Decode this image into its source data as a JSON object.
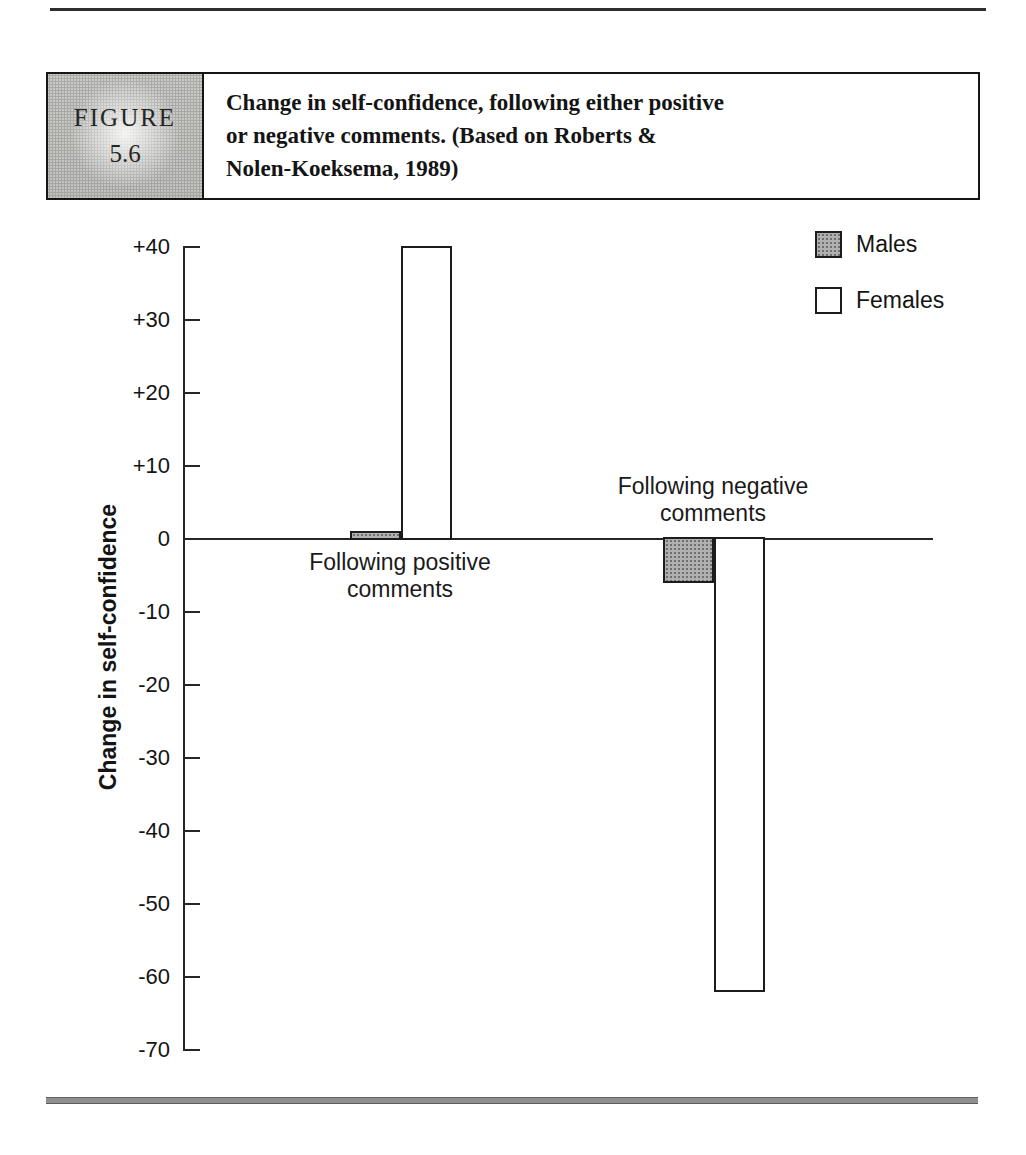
{
  "header": {
    "figure_word": "FIGURE",
    "figure_number": "5.6",
    "caption_lines": [
      "Change in self-confidence, following either positive",
      "or negative comments. (Based on Roberts &",
      "Nolen-Koeksema, 1989)"
    ]
  },
  "chart_data": {
    "type": "bar",
    "title": "Change in self-confidence, following either positive or negative comments",
    "categories": [
      "Following positive comments",
      "Following negative comments"
    ],
    "series": [
      {
        "name": "Males",
        "values": [
          1,
          -6
        ],
        "color": "#a9a9a9",
        "fill_style": "halftone-gray"
      },
      {
        "name": "Females",
        "values": [
          40,
          -62
        ],
        "color": "#ffffff",
        "fill_style": "white-outline"
      }
    ],
    "ylabel": "Change in self-confidence",
    "ylim": [
      -70,
      40
    ],
    "yticks": [
      40,
      30,
      20,
      10,
      0,
      -10,
      -20,
      -30,
      -40,
      -50,
      -60,
      -70
    ],
    "ytick_labels": [
      "+40",
      "+30",
      "+20",
      "+10",
      "0",
      "-10",
      "-20",
      "-30",
      "-40",
      "-50",
      "-60",
      "-70"
    ],
    "baseline": 0,
    "grid": false,
    "legend_position": "top-right"
  },
  "group_labels": {
    "positive": [
      "Following positive",
      "comments"
    ],
    "negative": [
      "Following negative",
      "comments"
    ]
  },
  "legend": {
    "items": [
      {
        "label": "Males",
        "swatch": "gray-halftone"
      },
      {
        "label": "Females",
        "swatch": "white"
      }
    ]
  },
  "colors": {
    "ink": "#1c1c1c",
    "male_fill": "#a9a9a9",
    "bottom_rule": "#8f8f8f"
  }
}
